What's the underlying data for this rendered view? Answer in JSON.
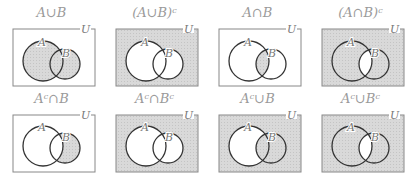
{
  "diagrams": [
    {
      "label": "A∪B",
      "shade": "union"
    },
    {
      "label": "(A∪B)ᶜ",
      "shade": "union-complement"
    },
    {
      "label": "A∩B",
      "shade": "intersection"
    },
    {
      "label": "(A∩B)ᶜ",
      "shade": "intersection-complement"
    },
    {
      "label": "Aᶜ∩B",
      "shade": "b-minus-a"
    },
    {
      "label": "Aᶜ∩Bᶜ",
      "shade": "union-complement"
    },
    {
      "label": "Aᶜ∪B",
      "shade": "a-complement-union-b"
    },
    {
      "label": "Aᶜ∪Bᶜ",
      "shade": "intersection-complement"
    }
  ],
  "set_labels": {
    "a": "A",
    "b": "B",
    "universe": "U"
  },
  "colors": {
    "shade": "#d9d9d9",
    "stroke": "#333333",
    "box": "#888888",
    "label": "#9a9a9a"
  }
}
